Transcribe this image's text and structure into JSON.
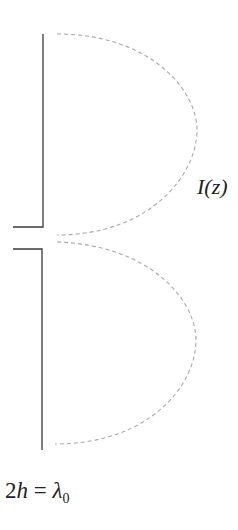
{
  "diagram": {
    "labels": {
      "current": "I(z)",
      "length_lhs_number": "2",
      "length_lhs_var": "h",
      "equals": " = ",
      "length_rhs_var": "λ",
      "length_rhs_sub": "0"
    },
    "elements": {
      "upper_arm": {
        "x": 43,
        "y_top": 34,
        "y_bottom": 227,
        "feed_x_start": 13
      },
      "lower_arm": {
        "x": 42,
        "y_top": 249,
        "y_bottom": 450,
        "feed_x_start": 13
      },
      "upper_current_lobe": {
        "start": [
          57,
          34
        ],
        "apex": [
          197,
          130
        ],
        "end": [
          57,
          235
        ]
      },
      "lower_current_lobe": {
        "start": [
          57,
          242
        ],
        "apex": [
          196,
          340
        ],
        "end": [
          55,
          444
        ]
      }
    },
    "colors": {
      "wire": "#3a3a3a",
      "current": "#a9a9a9",
      "text": "#222222",
      "background": "#ffffff"
    }
  }
}
